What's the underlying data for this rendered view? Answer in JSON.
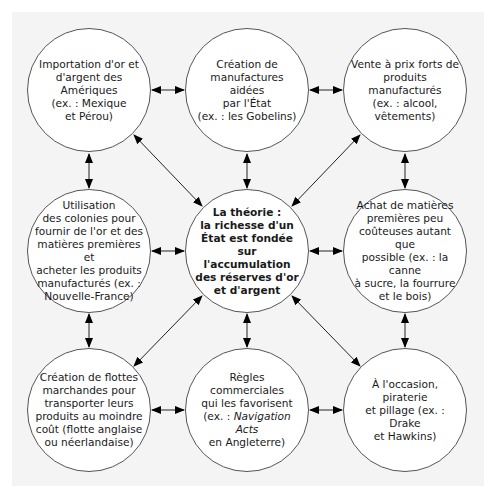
{
  "diagram": {
    "center": {
      "id": "theory",
      "text": "La théorie :\nla richesse d'un\nÉtat est fondée sur\nl'accumulation\ndes réserves d'or\net d'argent"
    },
    "nodes": [
      {
        "id": "import-gold",
        "position": "top-left",
        "text": "Importation d'or et\nd'argent des Amériques\n(ex. : Mexique\net Pérou)"
      },
      {
        "id": "manufactures",
        "position": "top-center",
        "text": "Création de\nmanufactures aidées\npar l'État\n(ex. : les Gobelins)"
      },
      {
        "id": "sell-high",
        "position": "top-right",
        "text": "Vente à prix forts de\nproduits manufacturés\n(ex. : alcool,\nvêtements)"
      },
      {
        "id": "colonies",
        "position": "middle-left",
        "text": "Utilisation\ndes colonies pour\nfournir de l'or et des\nmatières premières et\nacheter les produits\nmanufacturés (ex. :\nNouvelle-France)"
      },
      {
        "id": "raw-materials",
        "position": "middle-right",
        "text": "Achat de matières\npremières peu\ncoûteuses autant que\npossible (ex. : la canne\nà sucre, la fourrure\net le bois)"
      },
      {
        "id": "fleets",
        "position": "bottom-left",
        "text": "Création de flottes\nmarchandes pour\ntransporter leurs\nproduits au moindre\ncoût (flotte anglaise\nou néerlandaise)"
      },
      {
        "id": "trade-rules",
        "position": "bottom-center",
        "text_before": "Règles commerciales\nqui les favorisent\n(ex. : ",
        "text_italic": "Navigation Acts",
        "text_after": "\nen Angleterre)"
      },
      {
        "id": "piracy",
        "position": "bottom-right",
        "text": "À l'occasion, piraterie\net pillage (ex. : Drake\net Hawkins)"
      }
    ],
    "edges": [
      [
        "import-gold",
        "manufactures"
      ],
      [
        "manufactures",
        "sell-high"
      ],
      [
        "import-gold",
        "colonies"
      ],
      [
        "sell-high",
        "raw-materials"
      ],
      [
        "colonies",
        "fleets"
      ],
      [
        "raw-materials",
        "piracy"
      ],
      [
        "fleets",
        "trade-rules"
      ],
      [
        "trade-rules",
        "piracy"
      ],
      [
        "import-gold",
        "theory"
      ],
      [
        "manufactures",
        "theory"
      ],
      [
        "sell-high",
        "theory"
      ],
      [
        "colonies",
        "theory"
      ],
      [
        "raw-materials",
        "theory"
      ],
      [
        "fleets",
        "theory"
      ],
      [
        "trade-rules",
        "theory"
      ],
      [
        "piracy",
        "theory"
      ]
    ],
    "edge_style": "double-headed arrow"
  }
}
